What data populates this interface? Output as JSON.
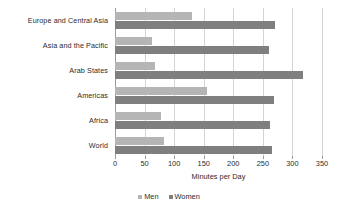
{
  "chart_data": {
    "type": "bar",
    "orientation": "horizontal",
    "title": "",
    "xlabel": "Minutes per Day",
    "ylabel": "",
    "xlim": [
      0,
      350
    ],
    "xticks": [
      0,
      50,
      100,
      150,
      200,
      250,
      300,
      350
    ],
    "grid": true,
    "legend_position": "bottom",
    "categories": [
      "Europe and Central Asia",
      "Asia and the Pacific",
      "Arab States",
      "Americas",
      "Africa",
      "World"
    ],
    "series": [
      {
        "name": "Men",
        "color": "#b5b5b5",
        "values": [
          130,
          63,
          68,
          155,
          77,
          83
        ]
      },
      {
        "name": "Women",
        "color": "#7f7f7f",
        "values": [
          271,
          261,
          318,
          268,
          262,
          265
        ]
      }
    ]
  },
  "legend": {
    "items": [
      {
        "label": "Men"
      },
      {
        "label": "Women"
      }
    ]
  }
}
